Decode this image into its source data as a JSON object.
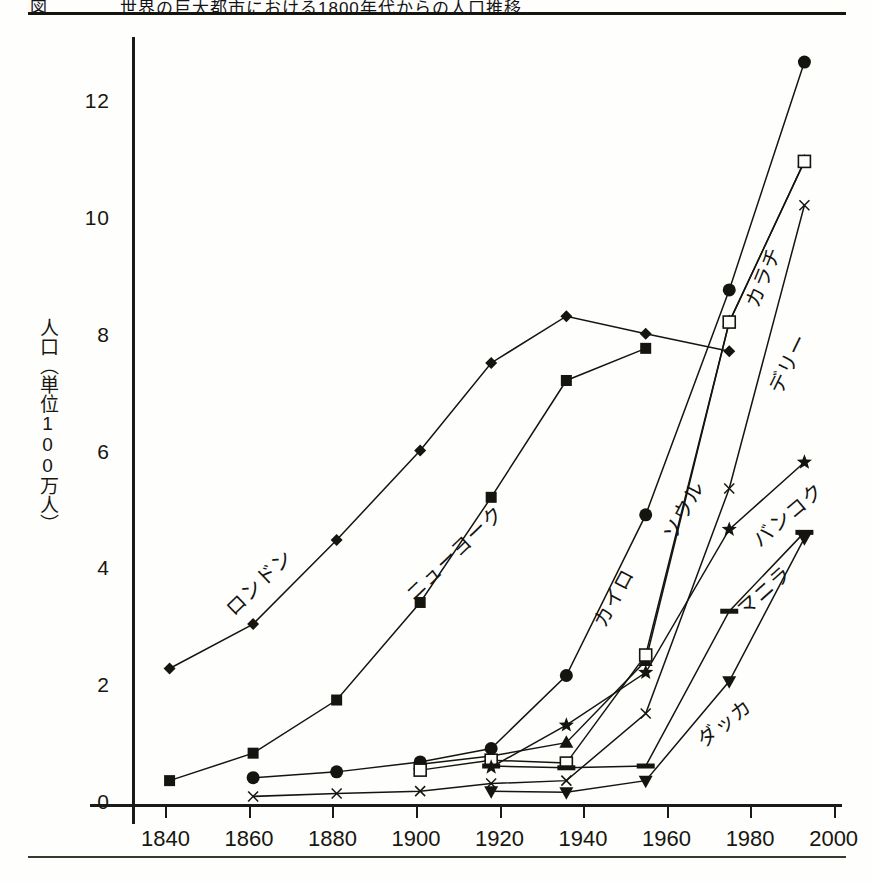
{
  "figure": {
    "caption": "図　　　　世界の巨大都市における1800年代からの人口推移",
    "ylabel": "人口（単位100万人）"
  },
  "axes": {
    "y_ticks": [
      "0",
      "2",
      "4",
      "6",
      "8",
      "10",
      "12"
    ],
    "y_values": [
      0,
      2,
      4,
      6,
      8,
      10,
      12
    ],
    "x_ticks": [
      "1840",
      "1860",
      "1880",
      "1900",
      "1920",
      "1940",
      "1960",
      "1980",
      "2000"
    ],
    "x_values": [
      1840,
      1860,
      1880,
      1900,
      1920,
      1940,
      1960,
      1980,
      2000
    ],
    "xlim": [
      1832,
      2002
    ],
    "ylim": [
      0,
      13.4
    ]
  },
  "chart_data": {
    "type": "line",
    "title": "図　　　　世界の巨大都市における1800年代からの人口推移",
    "xlabel": "",
    "ylabel": "人口（単位100万人）",
    "xlim": [
      1832,
      2002
    ],
    "ylim": [
      0,
      13.4
    ],
    "grid": false,
    "legend": "inline-labels",
    "series": [
      {
        "name": "ロンドン",
        "label_en": "London",
        "marker": "diamond",
        "x": [
          1841,
          1861,
          1881,
          1901,
          1918,
          1936,
          1955,
          1975
        ],
        "values": [
          2.32,
          3.08,
          4.52,
          6.05,
          7.55,
          8.35,
          8.05,
          7.75
        ]
      },
      {
        "name": "ニューヨーク",
        "label_en": "New York",
        "marker": "square-filled",
        "x": [
          1841,
          1861,
          1881,
          1901,
          1918,
          1936,
          1955
        ],
        "values": [
          0.4,
          0.87,
          1.78,
          3.45,
          5.25,
          7.25,
          7.8
        ]
      },
      {
        "name": "カイロ",
        "label_en": "Cairo",
        "marker": "triangle-up",
        "x": [
          1861,
          1881,
          1901,
          1918,
          1936,
          1955,
          1975,
          1993
        ],
        "values": [
          0.45,
          0.55,
          0.72,
          0.95,
          2.2,
          4.95,
          8.8,
          12.7
        ]
      },
      {
        "name": "ソウル",
        "label_en": "Seoul",
        "marker": "triangle-up",
        "x": [
          1901,
          1918,
          1936,
          1955,
          1975,
          1993
        ],
        "values": [
          0.68,
          0.82,
          1.05,
          2.45,
          8.25,
          11.0
        ]
      },
      {
        "name": "カラチ",
        "label_en": "Karachi",
        "marker": "square-open",
        "x": [
          1901,
          1918,
          1936,
          1955,
          1975,
          1993
        ],
        "values": [
          0.58,
          0.75,
          0.7,
          2.55,
          8.25,
          11.0
        ]
      },
      {
        "name": "デリー",
        "label_en": "Delhi",
        "marker": "cross",
        "x": [
          1861,
          1881,
          1901,
          1918,
          1936,
          1955,
          1975,
          1993
        ],
        "values": [
          0.13,
          0.18,
          0.22,
          0.35,
          0.4,
          1.55,
          5.4,
          10.25
        ]
      },
      {
        "name": "バンコク",
        "label_en": "Bangkok",
        "marker": "star",
        "x": [
          1918,
          1936,
          1955,
          1975,
          1993
        ],
        "values": [
          0.63,
          1.35,
          2.25,
          4.7,
          5.85
        ]
      },
      {
        "name": "マニラ",
        "label_en": "Manila",
        "marker": "dash",
        "x": [
          1918,
          1936,
          1955,
          1975,
          1993
        ],
        "values": [
          0.65,
          0.62,
          0.65,
          3.3,
          4.65
        ]
      },
      {
        "name": "ダッカ",
        "label_en": "Dhaka",
        "marker": "triangle-down",
        "x": [
          1918,
          1936,
          1955,
          1975,
          1993
        ],
        "values": [
          0.22,
          0.2,
          0.4,
          2.1,
          4.55
        ]
      }
    ]
  },
  "series_labels": [
    {
      "text": "ロンドン",
      "key": "london"
    },
    {
      "text": "ニューヨーク",
      "key": "new-york"
    },
    {
      "text": "カイロ",
      "key": "cairo"
    },
    {
      "text": "ソウル",
      "key": "seoul"
    },
    {
      "text": "カラチ",
      "key": "karachi"
    },
    {
      "text": "デリー",
      "key": "delhi"
    },
    {
      "text": "バンコク",
      "key": "bangkok"
    },
    {
      "text": "マニラ",
      "key": "manila"
    },
    {
      "text": "ダッカ",
      "key": "dhaka"
    }
  ]
}
